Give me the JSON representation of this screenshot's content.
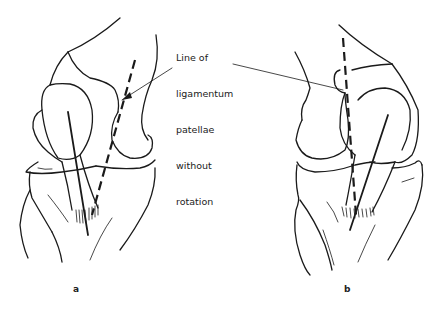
{
  "figure": {
    "annotation": {
      "lines": [
        "Line of",
        "ligamentum",
        "patellae",
        "without",
        "rotation"
      ]
    },
    "panels": [
      {
        "id": "a",
        "label": "a"
      },
      {
        "id": "b",
        "label": "b"
      }
    ],
    "colors": {
      "ink": "#1a1a1a",
      "background": "#ffffff"
    }
  }
}
